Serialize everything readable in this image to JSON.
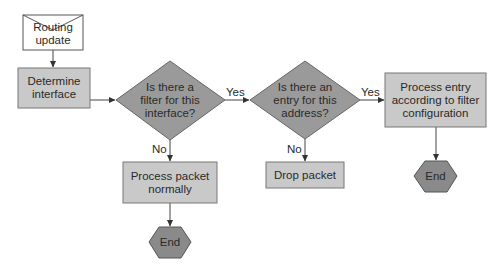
{
  "diagram": {
    "colors": {
      "box_fill": "#c9c9c9",
      "box_stroke": "#777777",
      "decision_fill": "#9a9a9a",
      "end_fill": "#8a8a8a",
      "start_fill": "#ffffff",
      "line": "#444444"
    },
    "nodes": {
      "start": {
        "type": "document-envelope",
        "label": "Routing update"
      },
      "determine": {
        "type": "process",
        "label": "Determine interface"
      },
      "filter_decision": {
        "type": "decision",
        "label": "Is there a filter for this interface?"
      },
      "entry_decision": {
        "type": "decision",
        "label": "Is there an entry for this address?"
      },
      "process_normally": {
        "type": "process",
        "label": "Process packet normally"
      },
      "drop": {
        "type": "process",
        "label": "Drop packet"
      },
      "process_entry": {
        "type": "process",
        "label": "Process entry according to filter configuration"
      },
      "end1": {
        "type": "terminator",
        "label": "End"
      },
      "end2": {
        "type": "terminator",
        "label": "End"
      }
    },
    "edges": [
      {
        "from": "start",
        "to": "determine",
        "label": ""
      },
      {
        "from": "determine",
        "to": "filter_decision",
        "label": ""
      },
      {
        "from": "filter_decision",
        "to": "entry_decision",
        "label": "Yes"
      },
      {
        "from": "filter_decision",
        "to": "process_normally",
        "label": "No"
      },
      {
        "from": "entry_decision",
        "to": "process_entry",
        "label": "Yes"
      },
      {
        "from": "entry_decision",
        "to": "drop",
        "label": "No"
      },
      {
        "from": "process_normally",
        "to": "end1",
        "label": ""
      },
      {
        "from": "process_entry",
        "to": "end2",
        "label": ""
      }
    ],
    "edge_labels": {
      "filter_yes": "Yes",
      "filter_no": "No",
      "entry_yes": "Yes",
      "entry_no": "No"
    }
  }
}
